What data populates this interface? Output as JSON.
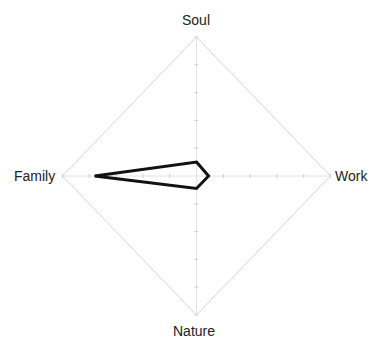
{
  "chart_data": {
    "type": "radar",
    "title": "",
    "axes": [
      "Soul",
      "Work",
      "Nature",
      "Family"
    ],
    "series": [
      {
        "name": "",
        "values": [
          0.5,
          0.45,
          0.45,
          3.8
        ],
        "color": "#111111"
      }
    ],
    "range": [
      0,
      5
    ],
    "ticks": 5,
    "grid": true,
    "legend": "none"
  },
  "labels": {
    "top": "Soul",
    "right": "Work",
    "bottom": "Nature",
    "left": "Family"
  },
  "colors": {
    "grid": "#d4d4d4",
    "line": "#111111"
  }
}
